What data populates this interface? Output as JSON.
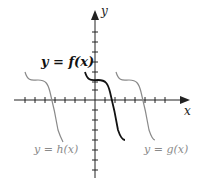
{
  "diagram": {
    "axes": {
      "x_label": "x",
      "y_label": "y",
      "x_tick_spacing_px": 10,
      "y_tick_spacing_px": 10
    },
    "curves": [
      {
        "id": "f",
        "label": "y = f(x)",
        "color": "#111111",
        "shift": "original"
      },
      {
        "id": "h",
        "label": "y = h(x)",
        "color": "#8a8a8a",
        "shift": "left"
      },
      {
        "id": "g",
        "label": "y = g(x)",
        "color": "#8a8a8a",
        "shift": "right"
      }
    ]
  }
}
